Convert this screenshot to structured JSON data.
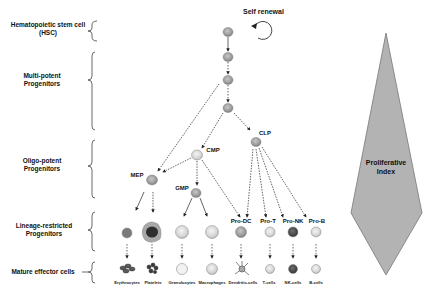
{
  "stages": [
    {
      "id": "hsc",
      "label_line1": "Hematopoietic stem cell",
      "label_line2": "(HSC)"
    },
    {
      "id": "multipotent",
      "label_line1": "Multi-potent",
      "label_line2": "Progenitors"
    },
    {
      "id": "oligopotent",
      "label_line1": "Oligo-potent",
      "label_line2": "Progenitors"
    },
    {
      "id": "lineage",
      "label_line1": "Lineage-restricted",
      "label_line2": "Progenitors"
    },
    {
      "id": "mature",
      "label_line1": "Mature effector cells",
      "label_line2": ""
    }
  ],
  "self_renewal": "Self renewal",
  "progenitors": {
    "cmp": "CMP",
    "clp": "CLP",
    "mep": "MEP",
    "gmp": "GMP",
    "pro_dc": "Pro-DC",
    "pro_t": "Pro-T",
    "pro_nk": "Pro-NK",
    "pro_b": "Pro-B"
  },
  "mature_cells": [
    "Erythrocytes",
    "Platelets",
    "Granulocytes",
    "Macrophages",
    "Dendritic-cells",
    "T-cells",
    "NK-cells",
    "B-cells"
  ],
  "proliferative_index": {
    "line1": "Proliferative",
    "line2": "Index",
    "fill": "#b3b3b3",
    "stroke": "#777777"
  },
  "colors": {
    "cell_gray": "#9a9a9a",
    "cell_light": "#d6d6d6",
    "cell_dark": "#4a4a4a",
    "arrow": "#222222"
  }
}
